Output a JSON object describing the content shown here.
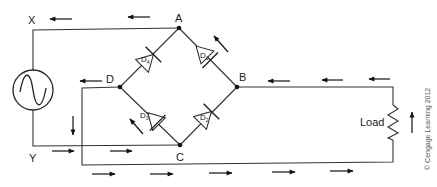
{
  "diagram": {
    "nodes": {
      "X": "X",
      "Y": "Y",
      "A": "A",
      "B": "B",
      "C": "C",
      "D": "D"
    },
    "diodes": [
      {
        "id": "D1",
        "label": "D",
        "sub": "1",
        "between": [
          "A",
          "B"
        ]
      },
      {
        "id": "D2",
        "label": "D",
        "sub": "2",
        "between": [
          "C",
          "B"
        ]
      },
      {
        "id": "D3",
        "label": "D",
        "sub": "3",
        "between": [
          "D",
          "C"
        ]
      },
      {
        "id": "D4",
        "label": "D",
        "sub": "4",
        "between": [
          "D",
          "A"
        ]
      }
    ],
    "load_label": "Load",
    "source": "ac-source",
    "copyright": "© Cengage Learning 2012"
  }
}
